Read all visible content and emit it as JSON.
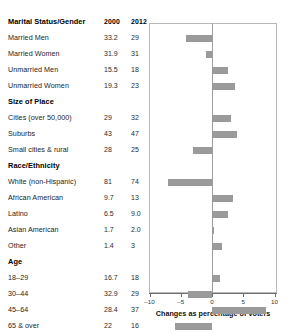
{
  "table": {
    "columns": {
      "label": "",
      "col_2000": "2000",
      "col_2012": "2012"
    },
    "sections": [
      {
        "heading": "Marital Status/Gender",
        "rows": [
          {
            "label": "Married Men",
            "v2000": "33.2",
            "v2012": "29",
            "change": -4.2
          },
          {
            "label": "Married Women",
            "v2000": "31.9",
            "v2012": "31",
            "change": -0.9
          },
          {
            "label": "Unmarried Men",
            "v2000": "15.5",
            "v2012": "18",
            "change": 2.5
          },
          {
            "label": "Unmarried Women",
            "v2000": "19.3",
            "v2012": "23",
            "change": 3.7
          }
        ]
      },
      {
        "heading": "Size of Place",
        "rows": [
          {
            "label": "Cities (over 50,000)",
            "v2000": "29",
            "v2012": "32",
            "change": 3.0
          },
          {
            "label": "Suburbs",
            "v2000": "43",
            "v2012": "47",
            "change": 4.0
          },
          {
            "label": "Small cities & rural",
            "v2000": "28",
            "v2012": "25",
            "change": -3.0
          }
        ]
      },
      {
        "heading": "Race/Ethnicity",
        "rows": [
          {
            "label": "White (non-Hispanic)",
            "v2000": "81",
            "v2012": "74",
            "change": -7.0
          },
          {
            "label": "African American",
            "v2000": "9.7",
            "v2012": "13",
            "change": 3.3
          },
          {
            "label": "Latino",
            "v2000": "6.5",
            "v2012": "9.0",
            "change": 2.5
          },
          {
            "label": "Asian American",
            "v2000": "1.7",
            "v2012": "2.0",
            "change": 0.3
          },
          {
            "label": "Other",
            "v2000": "1.4",
            "v2012": "3",
            "change": 1.6
          }
        ]
      },
      {
        "heading": "Age",
        "rows": [
          {
            "label": "18–29",
            "v2000": "16.7",
            "v2012": "18",
            "change": 1.3
          },
          {
            "label": "30–44",
            "v2000": "32.9",
            "v2012": "29",
            "change": -3.9
          },
          {
            "label": "45–64",
            "v2000": "28.4",
            "v2012": "37",
            "change": 8.6
          },
          {
            "label": "65 & over",
            "v2000": "22",
            "v2012": "16",
            "change": -6.0
          }
        ]
      }
    ]
  },
  "chart_data": {
    "type": "bar",
    "orientation": "horizontal",
    "title": "",
    "xlabel": "Changes as percentage of voters",
    "ylabel": "",
    "xlim": [
      -10,
      10
    ],
    "xticks": [
      -10,
      -5,
      0,
      5,
      10
    ],
    "xtick_labels": [
      "–10",
      "–5",
      "0",
      "5",
      "10"
    ],
    "grid": false,
    "legend": null,
    "zero_line": 0,
    "bar_color": "#9a9a9a",
    "categories": [
      "Married Men",
      "Married Women",
      "Unmarried Men",
      "Unmarried Women",
      "Cities (over 50,000)",
      "Suburbs",
      "Small cities & rural",
      "White (non-Hispanic)",
      "African American",
      "Latino",
      "Asian American",
      "Other",
      "18–29",
      "30–44",
      "45–64",
      "65 & over"
    ],
    "values": [
      -4.2,
      -0.9,
      2.5,
      3.7,
      3.0,
      4.0,
      -3.0,
      -7.0,
      3.3,
      2.5,
      0.3,
      1.6,
      1.3,
      -3.9,
      8.6,
      -6.0
    ],
    "series": [
      {
        "name": "2000",
        "values": [
          33.2,
          31.9,
          15.5,
          19.3,
          29,
          43,
          28,
          81,
          9.7,
          6.5,
          1.7,
          1.4,
          16.7,
          32.9,
          28.4,
          22
        ]
      },
      {
        "name": "2012",
        "values": [
          29,
          31,
          18,
          23,
          32,
          47,
          25,
          74,
          13,
          9.0,
          2.0,
          3,
          18,
          29,
          37,
          16
        ]
      }
    ]
  }
}
